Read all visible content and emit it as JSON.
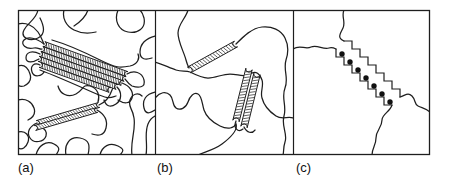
{
  "figure": {
    "colors": {
      "background": "#ffffff",
      "line": "#1e1e1e",
      "dot": "#111111"
    },
    "panels": {
      "a": {
        "label": "(a)",
        "crystallite_strips": 7,
        "crystallite_bundles": 2
      },
      "b": {
        "label": "(b)",
        "crystallite_strips": 3,
        "crystallite_bundles": 2
      },
      "c": {
        "label": "(c)",
        "dot_count": 7
      }
    },
    "glyphs": {
      "polymer_chain": "squiggle-line",
      "crystallite": "hatched-ladder-strip",
      "stem_marker": "filled-dot"
    }
  }
}
